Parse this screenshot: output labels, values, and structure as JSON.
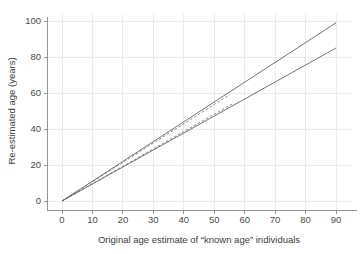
{
  "chart_data": {
    "type": "line",
    "title": "",
    "xlabel": "Original age estimate of “known age” individuals",
    "ylabel": "Re-estimated age (years)",
    "xlim": [
      -4,
      95
    ],
    "ylim": [
      -6,
      104
    ],
    "xticks": [
      0,
      10,
      20,
      30,
      40,
      50,
      60,
      70,
      80,
      90
    ],
    "yticks": [
      0,
      20,
      40,
      60,
      80,
      100
    ],
    "xtick_labels": [
      "0",
      "10",
      "20",
      "30",
      "40",
      "50",
      "60",
      "70",
      "80",
      "90"
    ],
    "ytick_labels": [
      "0",
      "20",
      "40",
      "60",
      "80",
      "100"
    ],
    "grid": true,
    "legend": "none",
    "series": [
      {
        "name": "upper-bound-solid",
        "style": "solid",
        "color": "#555a60",
        "x": [
          0,
          90
        ],
        "y": [
          0,
          99
        ]
      },
      {
        "name": "lower-bound-solid",
        "style": "solid",
        "color": "#555a60",
        "x": [
          0,
          90
        ],
        "y": [
          0,
          85
        ]
      },
      {
        "name": "upper-estimate-dashed",
        "style": "dashed",
        "color": "#6a6f75",
        "x": [
          0,
          55
        ],
        "y": [
          0,
          59
        ]
      },
      {
        "name": "lower-estimate-dashed",
        "style": "dashed",
        "color": "#6a6f75",
        "x": [
          0,
          56
        ],
        "y": [
          0,
          54
        ]
      }
    ]
  },
  "axes": {
    "x_title": "Original age estimate of “known age” individuals",
    "y_title": "Re-estimated age (years)"
  },
  "colors": {
    "grid": "#e2e2e6",
    "spine": "#8a8a8a",
    "series_solid": "#555a60",
    "series_dashed": "#6a6f75",
    "background": "#ffffff",
    "text": "#3c3c3c"
  }
}
